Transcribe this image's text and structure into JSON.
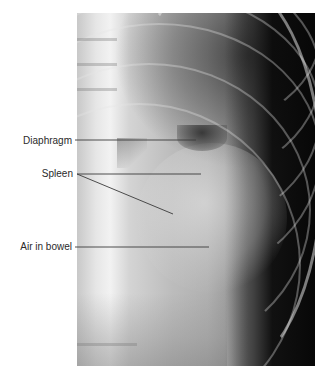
{
  "figure": {
    "type": "radiograph",
    "labels": [
      {
        "id": "diaphragm",
        "text": "Diaphragm"
      },
      {
        "id": "spleen",
        "text": "Spleen"
      },
      {
        "id": "air-in-bowel",
        "text": "Air in bowel"
      }
    ],
    "colors": {
      "background": "#ffffff",
      "label_text": "#2a2a2a",
      "leader_line": "#3a3a3a"
    }
  }
}
